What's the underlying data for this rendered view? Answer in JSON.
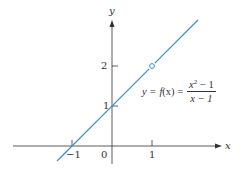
{
  "colors": {
    "axis": "#333333",
    "line": "#3c8dc4",
    "background": "#ffffff"
  },
  "axes": {
    "x_label": "x",
    "y_label": "y"
  },
  "ticks": {
    "x": [
      {
        "value": -1,
        "label": "−1"
      },
      {
        "value": 0,
        "label": "0"
      },
      {
        "value": 1,
        "label": "1"
      }
    ],
    "y": [
      {
        "value": 1,
        "label": "1"
      },
      {
        "value": 2,
        "label": "2"
      }
    ]
  },
  "equation": {
    "lhs": "y = ",
    "func": "f",
    "arg": "(x) = ",
    "numerator_base": "x",
    "numerator_exp": "2",
    "numerator_rest": " − 1",
    "denominator": "x − 1"
  },
  "graph": {
    "function": "f(x) = (x^2 - 1)/(x - 1)",
    "line": {
      "from": [
        -1.375,
        -0.375
      ],
      "to": [
        2.15,
        3.15
      ]
    },
    "hole": {
      "x": 1,
      "y": 2,
      "style": "open-circle"
    }
  }
}
